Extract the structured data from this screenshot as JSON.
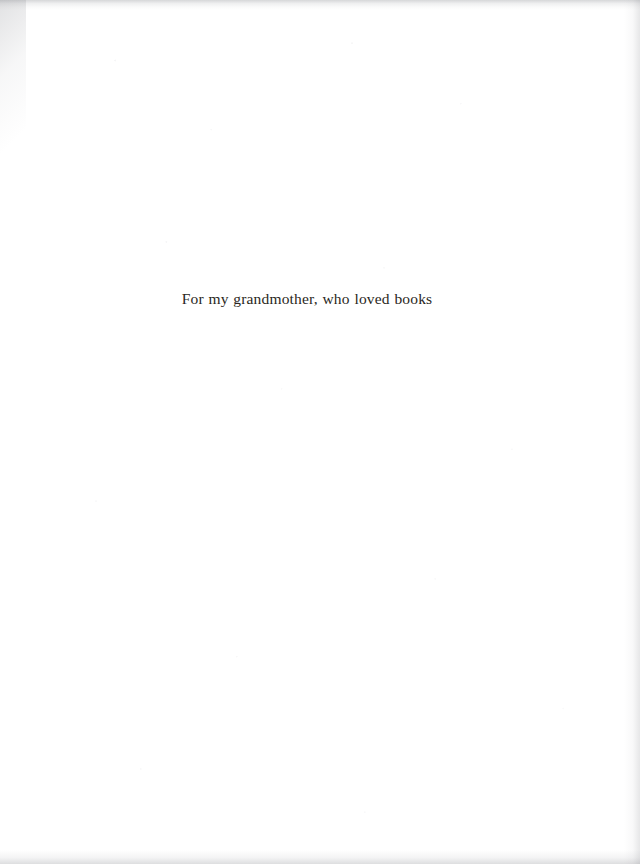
{
  "page": {
    "kind": "book-dedication-page",
    "width": 640,
    "height": 864,
    "background_color": "#ffffff",
    "paper_tone": "#fdfdfd"
  },
  "dedication": {
    "text": "For my grandmother, who loved books",
    "text_color": "#2a2722",
    "alignment": "center",
    "font_style": "old-style serif",
    "approx_font_size_px": 15.5,
    "baseline_y_px": 307,
    "spans_x_px": [
      209,
      458
    ]
  },
  "artifacts": {
    "top_edge_shadow": "#787a80",
    "left_corner_shadow": "#787a80",
    "right_edge_shadow": "#82848a",
    "bottom_edge_shadow": "#7d7f85",
    "grain_color": "#8c8c96"
  }
}
